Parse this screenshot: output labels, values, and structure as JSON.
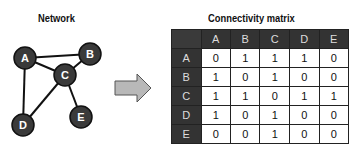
{
  "network": {
    "title": "Network",
    "nodes": [
      {
        "id": "A",
        "label": "A"
      },
      {
        "id": "B",
        "label": "B"
      },
      {
        "id": "C",
        "label": "C"
      },
      {
        "id": "D",
        "label": "D"
      },
      {
        "id": "E",
        "label": "E"
      }
    ],
    "edges": [
      [
        "A",
        "B"
      ],
      [
        "A",
        "C"
      ],
      [
        "A",
        "D"
      ],
      [
        "B",
        "C"
      ],
      [
        "C",
        "D"
      ],
      [
        "C",
        "E"
      ]
    ]
  },
  "arrow": {
    "color": "#b8b8b8"
  },
  "matrix": {
    "title": "Connectivity matrix",
    "columns": [
      "A",
      "B",
      "C",
      "D",
      "E"
    ],
    "rows": [
      {
        "label": "A",
        "values": [
          "0",
          "1",
          "1",
          "1",
          "0"
        ]
      },
      {
        "label": "B",
        "values": [
          "1",
          "0",
          "1",
          "0",
          "0"
        ]
      },
      {
        "label": "C",
        "values": [
          "1",
          "1",
          "0",
          "1",
          "1"
        ]
      },
      {
        "label": "D",
        "values": [
          "1",
          "0",
          "1",
          "0",
          "0"
        ]
      },
      {
        "label": "E",
        "values": [
          "0",
          "0",
          "1",
          "0",
          "0"
        ]
      }
    ]
  },
  "colors": {
    "node_fill": "#3a3a3a",
    "node_text": "#ffffff",
    "header_bg": "#333333"
  }
}
